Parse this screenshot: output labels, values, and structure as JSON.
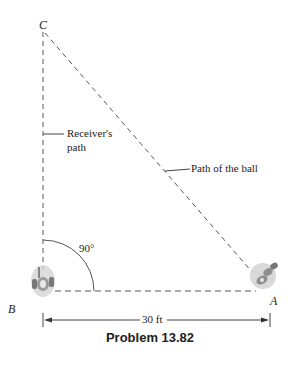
{
  "figure": {
    "points": {
      "A": "A",
      "B": "B",
      "C": "C"
    },
    "labels": {
      "receiver_path_line1": "Receiver's",
      "receiver_path_line2": "path",
      "ball_path": "Path of the ball",
      "angle": "90°",
      "distance": "30 ft"
    },
    "caption": "Problem 13.82",
    "colors": {
      "line": "#444444",
      "text": "#222222",
      "player_shadow": "#c8c8c8"
    }
  }
}
